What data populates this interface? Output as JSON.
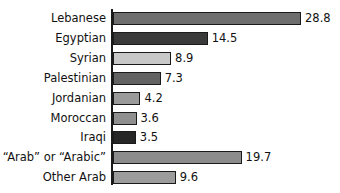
{
  "chart_data": {
    "type": "bar",
    "orientation": "horizontal",
    "title": "",
    "subtitle": "",
    "xlabel": "",
    "ylabel": "",
    "grid": false,
    "legend": null,
    "axis_visible": {
      "value_axis_ticks": false,
      "category_axis_line": true
    },
    "xlim": [
      0,
      28.8
    ],
    "categories": [
      "Lebanese",
      "Egyptian",
      "Syrian",
      "Palestinian",
      "Jordanian",
      "Moroccan",
      "Iraqi",
      "“Arab” or “Arabic”",
      "Other Arab"
    ],
    "values": [
      28.8,
      14.5,
      8.9,
      7.3,
      4.2,
      3.6,
      3.5,
      19.7,
      9.6
    ],
    "value_labels": [
      "28.8",
      "14.5",
      "8.9",
      "7.3",
      "4.2",
      "3.6",
      "3.5",
      "19.7",
      "9.6"
    ],
    "bar_colors": [
      "#6e6e6e",
      "#3a3a3a",
      "#c8c8c8",
      "#636363",
      "#9a9a9a",
      "#8f8f8f",
      "#262626",
      "#8c8c8c",
      "#9c9c9c"
    ],
    "bar_border_color": "#1a1a1a",
    "axis_color": "#1a1a1a",
    "text_color": "#111111",
    "background": "#ffffff"
  }
}
